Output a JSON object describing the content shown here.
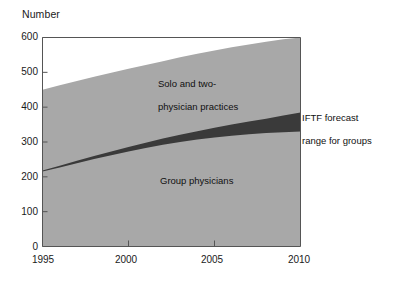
{
  "chart_data": {
    "type": "area",
    "title": "",
    "subtitle": "",
    "ylabel": "Number",
    "xlabel": "",
    "xlim": [
      1995,
      2010
    ],
    "ylim": [
      0,
      600
    ],
    "grid": false,
    "legend_position": "inline-annotations",
    "xticks": [
      "1995",
      "2000",
      "2005",
      "2010"
    ],
    "xtick_values": [
      1995,
      2000,
      2005,
      2010
    ],
    "yticks": [
      "0",
      "100",
      "200",
      "300",
      "400",
      "500",
      "600"
    ],
    "ytick_values": [
      0,
      100,
      200,
      300,
      400,
      500,
      600
    ],
    "x": [
      1995,
      1996,
      1997,
      1998,
      1999,
      2000,
      2001,
      2002,
      2003,
      2004,
      2005,
      2006,
      2007,
      2008,
      2009,
      2010
    ],
    "series": [
      {
        "name": "Total physicians (top of shaded area)",
        "color": "#a8a8a8",
        "values": [
          450,
          463,
          475,
          487,
          499,
          510,
          521,
          532,
          543,
          553,
          563,
          572,
          580,
          588,
          595,
          600
        ]
      },
      {
        "name": "IFTF forecast range for groups (lower bound)",
        "color": "#3a3a3a",
        "values": [
          215,
          227,
          239,
          251,
          262,
          273,
          283,
          292,
          300,
          307,
          313,
          318,
          322,
          326,
          328,
          330
        ]
      },
      {
        "name": "IFTF forecast range for groups (upper bound)",
        "color": "#3a3a3a",
        "values": [
          218,
          232,
          246,
          260,
          273,
          286,
          298,
          310,
          321,
          331,
          341,
          350,
          359,
          367,
          376,
          385
        ]
      }
    ],
    "annotations": [
      {
        "name": "solo-and-two-physician-practices",
        "text": "Solo and two-\nphysician practices",
        "x": 2000.5,
        "y": 470
      },
      {
        "name": "group-physicians",
        "text": "Group physicians",
        "x": 2000.6,
        "y": 215
      },
      {
        "name": "iftf-forecast-range-for-groups",
        "text": "IFTF forecast\nrange for groups",
        "x": 2010.4,
        "y": 400
      }
    ]
  },
  "axes": {
    "y_axis_title": "Number",
    "y_ticks": [
      "600",
      "500",
      "400",
      "300",
      "200",
      "100",
      "0"
    ],
    "x_ticks": [
      "1995",
      "2000",
      "2005",
      "2010"
    ]
  },
  "labels": {
    "solo_line1": "Solo and two-",
    "solo_line2": "physician practices",
    "group": "Group physicians",
    "iftf_line1": "IFTF forecast",
    "iftf_line2": "range for groups"
  },
  "colors": {
    "area_fill": "#a8a8a8",
    "band_fill": "#3a3a3a",
    "axis": "#444444",
    "text": "#1a1a1a",
    "background": "#ffffff"
  }
}
